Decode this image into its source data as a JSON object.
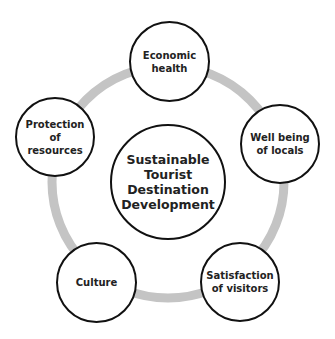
{
  "diagram": {
    "ring_color": "#c4c4c4",
    "stroke_color": "#111111",
    "center": {
      "label": "Sustainable Tourist Destination Development"
    },
    "nodes": [
      {
        "id": "economic-health",
        "label": "Economic health"
      },
      {
        "id": "well-being-of-locals",
        "label": "Well being of locals"
      },
      {
        "id": "satisfaction-of-visitors",
        "label": "Satisfaction of visitors"
      },
      {
        "id": "culture",
        "label": "Culture"
      },
      {
        "id": "protection-of-resources",
        "label": "Protection of resources"
      }
    ]
  }
}
